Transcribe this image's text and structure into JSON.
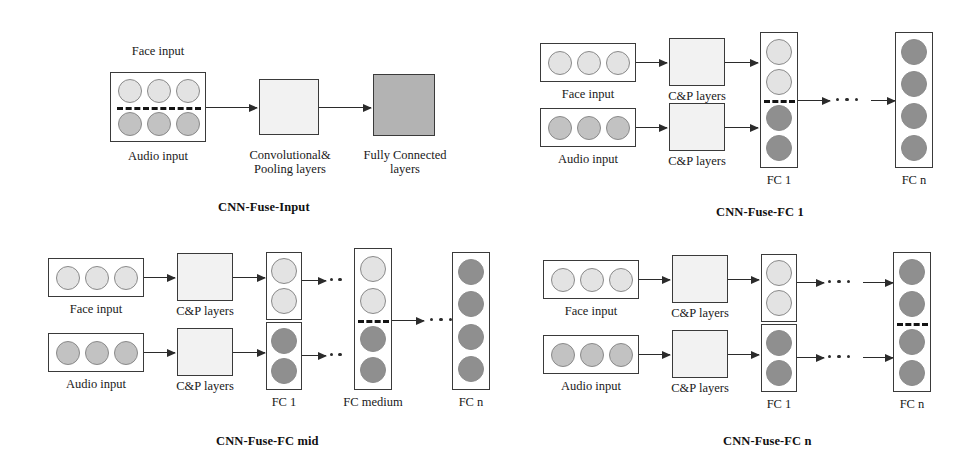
{
  "figure": {
    "kind": "neural-network-architecture-diagram",
    "panel_count": 4
  },
  "palette": {
    "stroke": "#3a3a3a",
    "arrow": "#2b2b2b",
    "cp_fill": "#f2f2f2",
    "fc_fill": "#b3b3b3",
    "node_light": "#e3e3e3",
    "node_mid": "#c2c2c2",
    "node_dark": "#8f8f8f",
    "dashed": "#141414",
    "background": "#ffffff"
  },
  "panels": [
    {
      "id": "cnn-fuse-input",
      "title": "CNN-Fuse-Input",
      "labels": {
        "face_input": "Face input",
        "audio_input": "Audio input",
        "conv_pool_line1": "Convolutional&",
        "conv_pool_line2": "Pooling layers",
        "fully_connected_line1": "Fully Connected",
        "fully_connected_line2": "layers"
      },
      "input_block": {
        "rows": 2,
        "cols": 3,
        "top_row_shade": "light",
        "bottom_row_shade": "mid",
        "has_dashed_separator": true
      },
      "stages": [
        "input-fused",
        "conv-pool-block",
        "fully-connected-block"
      ]
    },
    {
      "id": "cnn-fuse-fc1",
      "title": "CNN-Fuse-FC 1",
      "labels": {
        "face_input": "Face input",
        "audio_input": "Audio input",
        "face_cp": "C&P layers",
        "audio_cp": "C&P layers",
        "fc_first": "FC 1",
        "fc_last": "FC n"
      },
      "streams": 2,
      "nodes_per_input": 3,
      "fc1": {
        "nodes": 4,
        "top_shade": "light",
        "bottom_shade": "dark",
        "has_dashed_separator": true
      },
      "fcn": {
        "nodes": 4,
        "shade": "dark",
        "has_dashed_separator": false
      },
      "ellipsis_dots": 3
    },
    {
      "id": "cnn-fuse-fc-mid",
      "title": "CNN-Fuse-FC mid",
      "labels": {
        "face_input": "Face input",
        "audio_input": "Audio input",
        "face_cp": "C&P layers",
        "audio_cp": "C&P layers",
        "fc_first": "FC 1",
        "fc_medium": "FC medium",
        "fc_last": "FC n"
      },
      "streams": 2,
      "nodes_per_input": 3,
      "fc1_top": {
        "nodes": 2,
        "shade": "light"
      },
      "fc1_bottom": {
        "nodes": 2,
        "shade": "dark"
      },
      "fc_medium": {
        "nodes": 4,
        "top_shade": "light",
        "bottom_shade": "dark",
        "has_dashed_separator": true
      },
      "fcn": {
        "nodes": 4,
        "shade": "dark",
        "has_dashed_separator": false
      },
      "ellipsis_dots": 3
    },
    {
      "id": "cnn-fuse-fcn",
      "title": "CNN-Fuse-FC n",
      "labels": {
        "face_input": "Face input",
        "audio_input": "Audio input",
        "face_cp": "C&P layers",
        "audio_cp": "C&P layers",
        "fc_first": "FC 1",
        "fc_last": "FC n"
      },
      "streams": 2,
      "nodes_per_input": 3,
      "fc1_top": {
        "nodes": 2,
        "shade": "light"
      },
      "fc1_bottom": {
        "nodes": 2,
        "shade": "dark"
      },
      "fcn": {
        "nodes": 4,
        "top_shade": "dark",
        "bottom_shade": "dark",
        "has_dashed_separator": true
      },
      "ellipsis_dots": 3
    }
  ]
}
